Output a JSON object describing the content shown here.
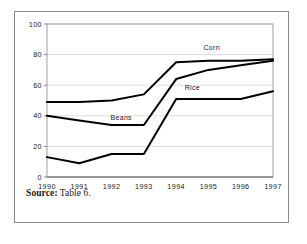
{
  "figure": {
    "source_label": "Source:",
    "source_value": "Table 6."
  },
  "chart_data": {
    "type": "line",
    "title": "",
    "xlabel": "",
    "ylabel": "",
    "categories": [
      "1990",
      "1991",
      "1992",
      "1993",
      "1994",
      "1995",
      "1996",
      "1997"
    ],
    "x": [
      1990,
      1991,
      1992,
      1993,
      1994,
      1995,
      1996,
      1997
    ],
    "ylim": [
      0,
      100
    ],
    "xlim": [
      1990,
      1997
    ],
    "ytick_labels": [
      "0",
      "20",
      "40",
      "60",
      "80",
      "100"
    ],
    "ytick_values": [
      0,
      20,
      40,
      60,
      80,
      100
    ],
    "grid": "horizontal",
    "legend_position": "inline-labels",
    "series": [
      {
        "name": "Corn",
        "values": [
          49,
          49,
          50,
          54,
          75,
          76,
          76,
          77
        ],
        "color": "#000000",
        "label_x": 1995.1,
        "label_y": 83
      },
      {
        "name": "Beans",
        "values": [
          40,
          37,
          34,
          34,
          64,
          70,
          73,
          76
        ],
        "color": "#000000",
        "label_x": 1992.3,
        "label_y": 37
      },
      {
        "name": "Rice",
        "values": [
          13,
          9,
          15,
          15,
          51,
          51,
          51,
          56
        ],
        "color": "#000000",
        "label_x": 1994.5,
        "label_y": 57
      }
    ]
  }
}
